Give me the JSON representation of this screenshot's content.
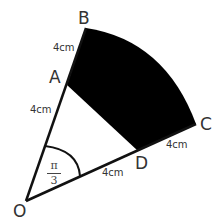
{
  "diagram": {
    "points": {
      "O": {
        "label": "O",
        "x": 26,
        "y": 201
      },
      "A": {
        "label": "A",
        "x": 67,
        "y": 85
      },
      "B": {
        "label": "B",
        "x": 86,
        "y": 28
      },
      "C": {
        "label": "C",
        "x": 196,
        "y": 124
      },
      "D": {
        "label": "D",
        "x": 138,
        "y": 151
      }
    },
    "lengths": {
      "AB": "4cm",
      "OA": "4cm",
      "OD": "4cm",
      "DC": "4cm"
    },
    "angle": {
      "numerator": "π",
      "denominator": "3"
    },
    "colors": {
      "shaded_region": "#000000",
      "lines": "#111111"
    }
  }
}
